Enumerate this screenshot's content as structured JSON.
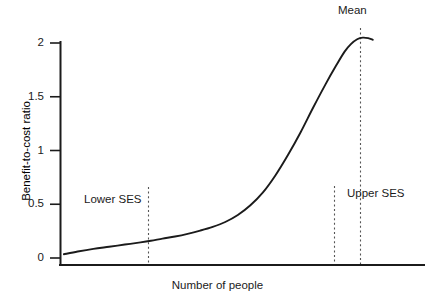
{
  "chart_data": {
    "type": "line",
    "title": "",
    "xlabel": "Number of people",
    "ylabel": "Benefit-to-cost ratio",
    "ylim": [
      0,
      2.15
    ],
    "xlim": [
      0,
      100
    ],
    "grid": false,
    "legend": "none",
    "ytick_labels": [
      "0",
      "0.5",
      "1",
      "1.5",
      "2"
    ],
    "ytick_values": [
      0,
      0.5,
      1,
      1.5,
      2
    ],
    "xtick_labels": [],
    "series": [
      {
        "name": "Benefit-to-cost ratio",
        "color": "#1b1b1b",
        "x": [
          0.6,
          5,
          10,
          15,
          20,
          25,
          28.3,
          32,
          36,
          40,
          44,
          48,
          52,
          56,
          60,
          64,
          68,
          72,
          76,
          80,
          84,
          87.3,
          90,
          92,
          94,
          95.8,
          97.5,
          99
        ],
        "y": [
          0.035,
          0.06,
          0.085,
          0.105,
          0.125,
          0.145,
          0.16,
          0.18,
          0.2,
          0.225,
          0.255,
          0.29,
          0.335,
          0.4,
          0.49,
          0.61,
          0.77,
          0.96,
          1.17,
          1.4,
          1.62,
          1.79,
          1.92,
          1.99,
          2.035,
          2.05,
          2.045,
          2.03
        ]
      }
    ],
    "annotations": [
      {
        "id": "lower-ses",
        "label": "Lower SES",
        "line_x": 28.3,
        "label_x": 13.5,
        "label_y": 0.565,
        "line_y_top": 0.72,
        "line_y_bottom": 0.0,
        "style": "dashed"
      },
      {
        "id": "upper-ses-boundary",
        "label": "",
        "line_x": 79.5,
        "line_y_top": 0.735,
        "line_y_bottom": 0.0,
        "style": "dashed"
      },
      {
        "id": "upper-ses",
        "label": "Upper SES",
        "line_x": 86.7,
        "label_x": 89.5,
        "label_y": 0.68,
        "line_y_top": 2.24,
        "line_y_bottom": 0.0,
        "style": "dashed"
      },
      {
        "id": "mean",
        "label": "Mean",
        "line_x": 86.7,
        "label_x": 86.7,
        "label_y": 2.33,
        "style": "dashed"
      }
    ]
  },
  "axis": {
    "y_title": "Benefit-to-cost ratio",
    "x_title": "Number of people",
    "tick_0": "0",
    "tick_05": "0.5",
    "tick_1": "1",
    "tick_15": "1.5",
    "tick_2": "2"
  },
  "labels": {
    "mean": "Mean",
    "lower_ses": "Lower SES",
    "upper_ses": "Upper SES"
  },
  "colors": {
    "ink": "#1b1b1b",
    "curve": "#1b1b1b",
    "dashed": "#555555",
    "background": "#ffffff"
  }
}
